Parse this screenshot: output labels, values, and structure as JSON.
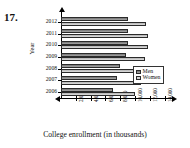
{
  "problem": {
    "number": "17."
  },
  "legend": {
    "position": "inside-bottom-right",
    "entries": [
      {
        "label": "Men",
        "color": "#8f8f8f"
      },
      {
        "label": "Women",
        "color": "#c9c9c9"
      }
    ]
  },
  "axes": {
    "x_title": "College enrollment (in thousands)",
    "y_title": "Year"
  },
  "chart_data": {
    "type": "bar",
    "orientation": "horizontal",
    "title": "",
    "subtitle": "",
    "xlabel": "College enrollment (in thousands)",
    "ylabel": "Year",
    "categories": [
      "2006",
      "2007",
      "2008",
      "2009",
      "2010",
      "2011",
      "2012"
    ],
    "series": [
      {
        "name": "Men",
        "color": "#8f8f8f",
        "values": [
          7000,
          7500,
          8000,
          8800,
          9000,
          9000,
          9000
        ]
      },
      {
        "name": "Women",
        "color": "#c9c9c9",
        "values": [
          10000,
          10800,
          10800,
          11400,
          11800,
          11800,
          11500
        ]
      }
    ],
    "xlim": [
      0,
      15000
    ],
    "ylim": null,
    "xticks": [
      2000,
      4000,
      6000,
      8000,
      10000,
      12000,
      14000
    ],
    "xticklabels": [
      "2,000",
      "4,000",
      "6,000",
      "8,000",
      "10,000",
      "12,000",
      "14,000"
    ],
    "yticklabels": [
      "2012",
      "2011",
      "2010",
      "2009",
      "2008",
      "2007",
      "2006"
    ],
    "grid": false,
    "legend_position": "inside-bottom-right"
  }
}
